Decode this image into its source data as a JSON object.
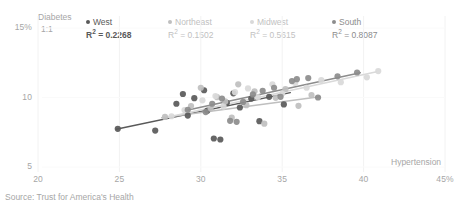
{
  "chart_data": {
    "type": "scatter",
    "title": "",
    "xlabel": "Hypertension",
    "ylabel": "Diabetes",
    "ylabel_secondary": "1:1",
    "xlim": [
      20,
      45
    ],
    "ylim": [
      5,
      15
    ],
    "grid": "faint-vertical-and-horizontal",
    "legend_position": "top",
    "xticks": [
      {
        "value": 20,
        "label": "20"
      },
      {
        "value": 25,
        "label": "25"
      },
      {
        "value": 30,
        "label": "30"
      },
      {
        "value": 35,
        "label": "35"
      },
      {
        "value": 40,
        "label": "40"
      },
      {
        "value": 45,
        "label": "45%"
      }
    ],
    "yticks": [
      {
        "value": 15,
        "label": "15%"
      },
      {
        "value": 10,
        "label": "10"
      },
      {
        "value": 5,
        "label": "5"
      }
    ],
    "source": "Source: Trust for America's Health",
    "series": [
      {
        "name": "West",
        "r2_label": "R² = 0.2268",
        "r2": 0.2268,
        "color": "#595959",
        "trendline": {
          "x0": 24.8,
          "y0": 7.72,
          "x1": 35.5,
          "y1": 10.35
        },
        "points": [
          [
            24.9,
            7.75
          ],
          [
            27.2,
            7.62
          ],
          [
            28.5,
            9.55
          ],
          [
            28.9,
            10.25
          ],
          [
            29.2,
            8.7
          ],
          [
            29.6,
            9.95
          ],
          [
            30.2,
            10.52
          ],
          [
            30.4,
            9.05
          ],
          [
            30.8,
            7.05
          ],
          [
            31.2,
            6.98
          ],
          [
            31.6,
            9.62
          ],
          [
            32.0,
            10.3
          ],
          [
            32.4,
            9.28
          ],
          [
            33.1,
            9.92
          ],
          [
            33.6,
            8.3
          ],
          [
            34.2,
            10.05
          ],
          [
            35.1,
            9.5
          ]
        ]
      },
      {
        "name": "Northeast",
        "r2_label": "R² = 0.1502",
        "r2": 0.1502,
        "color": "#bfbfbf",
        "trendline": {
          "x0": 27.6,
          "y0": 8.55,
          "x1": 37.3,
          "y1": 10.05
        },
        "points": [
          [
            27.8,
            8.6
          ],
          [
            29.4,
            9.38
          ],
          [
            30.0,
            10.7
          ],
          [
            30.6,
            9.2
          ],
          [
            31.0,
            10.02
          ],
          [
            31.5,
            9.72
          ],
          [
            31.9,
            8.55
          ],
          [
            32.3,
            10.95
          ],
          [
            32.8,
            9.45
          ],
          [
            33.3,
            10.45
          ],
          [
            33.9,
            8.12
          ],
          [
            34.6,
            9.98
          ],
          [
            35.2,
            10.6
          ],
          [
            36.0,
            9.4
          ],
          [
            36.8,
            10.18
          ]
        ]
      },
      {
        "name": "Midwest",
        "r2_label": "R² = 0.5615",
        "r2": 0.5615,
        "color": "#d9d9d9",
        "trendline": {
          "x0": 28.0,
          "y0": 8.6,
          "x1": 40.8,
          "y1": 11.85
        },
        "points": [
          [
            28.2,
            8.65
          ],
          [
            29.0,
            9.1
          ],
          [
            30.1,
            9.8
          ],
          [
            30.9,
            10.1
          ],
          [
            31.4,
            9.35
          ],
          [
            32.1,
            10.38
          ],
          [
            32.9,
            10.65
          ],
          [
            33.5,
            10.02
          ],
          [
            34.4,
            10.95
          ],
          [
            35.0,
            10.28
          ],
          [
            35.8,
            11.05
          ],
          [
            36.5,
            10.7
          ],
          [
            37.4,
            11.25
          ],
          [
            38.6,
            11.1
          ],
          [
            40.2,
            11.45
          ],
          [
            40.9,
            11.9
          ]
        ]
      },
      {
        "name": "South",
        "r2_label": "R² = 0.8087",
        "r2": 0.8087,
        "color": "#8c8c8c",
        "trendline": {
          "x0": 29.0,
          "y0": 9.05,
          "x1": 39.8,
          "y1": 11.78
        },
        "points": [
          [
            29.2,
            9.12
          ],
          [
            30.3,
            8.95
          ],
          [
            30.7,
            9.55
          ],
          [
            31.3,
            9.92
          ],
          [
            31.8,
            8.32
          ],
          [
            32.2,
            8.25
          ],
          [
            32.6,
            9.68
          ],
          [
            33.2,
            10.22
          ],
          [
            33.8,
            10.48
          ],
          [
            34.5,
            10.7
          ],
          [
            34.9,
            10.05
          ],
          [
            35.6,
            11.18
          ],
          [
            35.9,
            11.32
          ],
          [
            36.6,
            11.4
          ],
          [
            37.2,
            10.0
          ],
          [
            38.4,
            11.52
          ],
          [
            39.6,
            11.8
          ]
        ]
      }
    ]
  }
}
